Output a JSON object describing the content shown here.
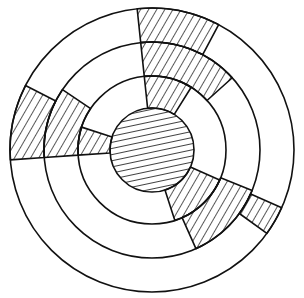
{
  "diagram": {
    "center": {
      "x": 152,
      "y": 150
    },
    "rings": [
      {
        "name": "core",
        "r": 42,
        "fill": "horizontal-hatch"
      },
      {
        "name": "inner-ring",
        "r_inner": 42,
        "r_outer": 74
      },
      {
        "name": "middle-ring",
        "r_inner": 74,
        "r_outer": 108
      },
      {
        "name": "outer-ring",
        "r_inner": 108,
        "r_outer": 142
      }
    ],
    "hatched_sectors": [
      {
        "name": "top-right-outer",
        "ring": "outer-ring",
        "start_deg": -96,
        "end_deg": -62
      },
      {
        "name": "top-right-middle",
        "ring": "middle-ring",
        "start_deg": -96,
        "end_deg": -42
      },
      {
        "name": "top-right-inner",
        "ring": "inner-ring",
        "start_deg": -96,
        "end_deg": -58
      },
      {
        "name": "left-outer",
        "ring": "outer-ring",
        "start_deg": 176,
        "end_deg": 207
      },
      {
        "name": "left-middle",
        "ring": "middle-ring",
        "start_deg": 176,
        "end_deg": 214
      },
      {
        "name": "left-inner",
        "ring": "inner-ring",
        "start_deg": 176,
        "end_deg": 198
      },
      {
        "name": "bottom-right-outer",
        "ring": "outer-ring",
        "start_deg": 24,
        "end_deg": 36
      },
      {
        "name": "bottom-right-middle",
        "ring": "middle-ring",
        "start_deg": 22,
        "end_deg": 66
      },
      {
        "name": "bottom-right-inner",
        "ring": "inner-ring",
        "start_deg": 24,
        "end_deg": 72
      }
    ],
    "colors": {
      "stroke": "#111111",
      "background": "#ffffff"
    }
  }
}
